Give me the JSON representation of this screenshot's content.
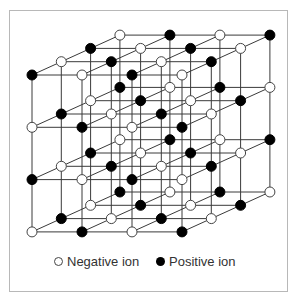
{
  "diagram": {
    "title": "",
    "type": "ionic crystal lattice (3D cubic, 4x4x4)",
    "grid": {
      "columns": 4,
      "rows": 4,
      "layers": 4
    },
    "geometry": {
      "origin": [
        32,
        75
      ],
      "col_step": [
        50,
        0
      ],
      "row_step": [
        0,
        52.3
      ],
      "layer_step": [
        29.3,
        -13.3
      ],
      "node_radius": 5
    },
    "colors": {
      "line": "#3a3a3a",
      "negative_fill": "#ffffff",
      "negative_stroke": "#444444",
      "positive_fill": "#000000",
      "frame": "#b8b8b8"
    },
    "rule": "positive ion where (col+row+layer) is even; negative otherwise"
  },
  "legend": {
    "items": [
      {
        "symbol": "open-circle",
        "label": "Negative ion"
      },
      {
        "symbol": "filled-circle",
        "label": "Positive ion"
      }
    ]
  }
}
